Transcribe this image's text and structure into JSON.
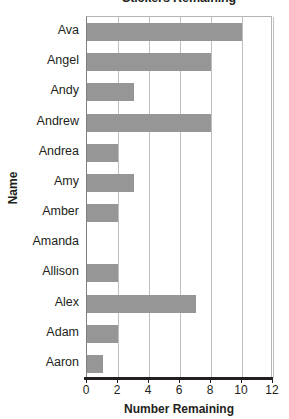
{
  "chart_data": {
    "type": "bar",
    "orientation": "horizontal",
    "title": "Stickers Remaining",
    "xlabel": "Number Remaining",
    "ylabel": "Name",
    "categories": [
      "Ava",
      "Angel",
      "Andy",
      "Andrew",
      "Andrea",
      "Amy",
      "Amber",
      "Amanda",
      "Allison",
      "Alex",
      "Adam",
      "Aaron"
    ],
    "values": [
      10,
      8,
      3,
      8,
      2,
      3,
      2,
      0,
      2,
      7,
      2,
      1
    ],
    "xlim": [
      0,
      12
    ],
    "xticks": [
      0,
      2,
      4,
      6,
      8,
      10,
      12
    ],
    "xtick_labels": [
      "0",
      "2",
      "4",
      "6",
      "8",
      "10",
      "12"
    ],
    "grid": "vertical",
    "legend": "none",
    "bar_color": "#969696",
    "gridline_color": "#bfbfbf",
    "axis_color": "#231f20"
  }
}
